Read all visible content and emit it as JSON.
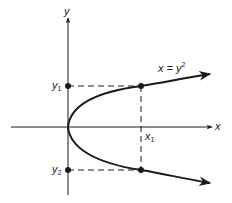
{
  "diagram": {
    "axes": {
      "x_label": "x",
      "y_label": "y"
    },
    "curve": {
      "equation_lhs": "x = y",
      "equation_exp": "2",
      "shape": "parabola opening right, vertex at origin"
    },
    "points": {
      "x1_label_base": "x",
      "x1_label_sub": "1",
      "y1_label_base": "y",
      "y1_label_sub": "1",
      "y2_label_base": "y",
      "y2_label_sub": "2"
    },
    "colors": {
      "ink": "#1a1a1a",
      "background": "#ffffff"
    }
  }
}
